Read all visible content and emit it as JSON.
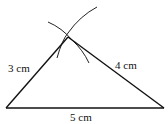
{
  "diagram": {
    "type": "triangle-construction",
    "labels": {
      "left_side": "3 cm",
      "right_side": "4 cm",
      "base": "5 cm"
    },
    "vertices": {
      "bottom_left": [
        6,
        108
      ],
      "bottom_right": [
        164,
        108
      ],
      "apex": [
        68,
        37
      ]
    },
    "stroke_color": "#111111",
    "arc_color": "#222222"
  }
}
